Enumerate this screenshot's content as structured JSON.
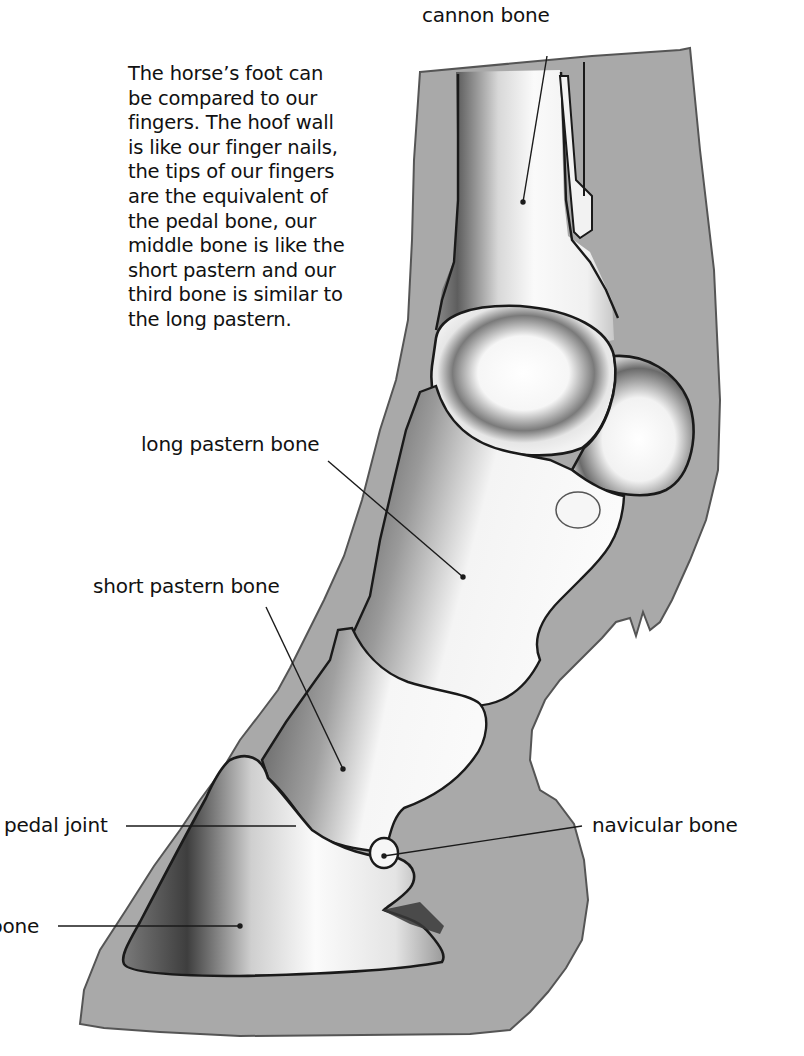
{
  "caption": {
    "lines": [
      "The horse’s foot can",
      "be compared to our",
      "fingers. The hoof wall",
      "is like our finger nails,",
      "the tips of our fingers",
      "are the equivalent of",
      "the pedal bone, our",
      "middle bone is like the",
      "short pastern and our",
      "third bone is similar to",
      "the long pastern."
    ]
  },
  "labels": {
    "cannon_bone": "cannon bone",
    "long_pastern_bone": "long pastern bone",
    "short_pastern_bone": "short pastern bone",
    "pedal_joint": "pedal joint",
    "navicular_bone": "navicular bone",
    "pedal_bone": "bone"
  },
  "colors": {
    "background": "#ffffff",
    "soft_tissue": "#a9a9a9",
    "bone_fill": "#f4f4f4",
    "bone_shadow": "#6e6e6e",
    "outline": "#1a1a1a",
    "text": "#111111"
  }
}
